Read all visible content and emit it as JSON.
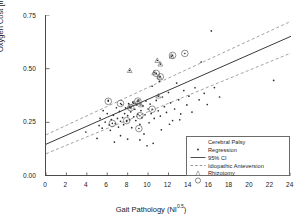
{
  "chart_data": {
    "type": "scatter",
    "title": "",
    "xlabel": "Gait Pathology (NI0.5)",
    "xlabel_base": "Gait Pathology (NI",
    "xlabel_sup": "0.5",
    "xlabel_tail": ")",
    "ylabel": "Oxygen Cost  [ml / m * kg]",
    "xlim": [
      0,
      24
    ],
    "ylim": [
      0.0,
      0.75
    ],
    "xticks": [
      0,
      2,
      4,
      6,
      8,
      10,
      12,
      14,
      16,
      18,
      20,
      22,
      24
    ],
    "yticks": [
      0.0,
      0.25,
      0.5,
      0.75
    ],
    "ytick_labels": [
      "0.00",
      "0.25",
      "0.50",
      "0.75"
    ],
    "xtick_labels": [
      "0",
      "2",
      "4",
      "6",
      "8",
      "10",
      "12",
      "14",
      "16",
      "18",
      "20",
      "22",
      "24"
    ],
    "grid": false,
    "legend_position": "lower-right",
    "colors": {
      "axis": "#4a4a4a",
      "point": "#2b2b2b",
      "regression": "#3a3a3a",
      "ci": "#8a8a8a",
      "anteversion": "#555555",
      "rhizotomy": "#555555",
      "legend_border": "#6b6b6b"
    },
    "legend": [
      {
        "label": "Cerebral Palsy",
        "key": "dot-marker"
      },
      {
        "label": "Regression",
        "key": "solid-line"
      },
      {
        "label": "95% CI",
        "key": "dashed-line"
      },
      {
        "label": "Idiopathic Anteversion",
        "key": "triangle-marker"
      },
      {
        "label": "Rhizotomy",
        "key": "circle-marker"
      }
    ],
    "regression": {
      "x": [
        0,
        24
      ],
      "y": [
        0.148,
        0.651
      ]
    },
    "ci_upper": {
      "x": [
        0,
        24
      ],
      "y": [
        0.192,
        0.721
      ]
    },
    "ci_lower": {
      "x": [
        0,
        24
      ],
      "y": [
        0.104,
        0.573
      ]
    },
    "series": [
      {
        "name": "Cerebral Palsy",
        "marker": "dot",
        "points": [
          [
            3.9,
            0.205
          ],
          [
            5.0,
            0.175
          ],
          [
            5.2,
            0.235
          ],
          [
            5.3,
            0.268
          ],
          [
            5.5,
            0.223
          ],
          [
            5.6,
            0.305
          ],
          [
            5.8,
            0.251
          ],
          [
            6.0,
            0.291
          ],
          [
            6.1,
            0.352
          ],
          [
            6.2,
            0.238
          ],
          [
            6.3,
            0.213
          ],
          [
            6.4,
            0.263
          ],
          [
            6.6,
            0.283
          ],
          [
            6.8,
            0.244
          ],
          [
            6.9,
            0.318
          ],
          [
            7.0,
            0.268
          ],
          [
            7.1,
            0.228
          ],
          [
            7.2,
            0.301
          ],
          [
            7.3,
            0.255
          ],
          [
            7.4,
            0.333
          ],
          [
            7.5,
            0.272
          ],
          [
            7.6,
            0.239
          ],
          [
            7.7,
            0.291
          ],
          [
            7.8,
            0.317
          ],
          [
            7.9,
            0.254
          ],
          [
            8.0,
            0.281
          ],
          [
            8.1,
            0.337
          ],
          [
            8.2,
            0.262
          ],
          [
            8.3,
            0.299
          ],
          [
            8.4,
            0.225
          ],
          [
            8.5,
            0.344
          ],
          [
            8.6,
            0.276
          ],
          [
            8.7,
            0.311
          ],
          [
            8.8,
            0.258
          ],
          [
            8.9,
            0.331
          ],
          [
            9.0,
            0.288
          ],
          [
            9.1,
            0.354
          ],
          [
            9.2,
            0.241
          ],
          [
            9.3,
            0.305
          ],
          [
            9.4,
            0.272
          ],
          [
            9.5,
            0.327
          ],
          [
            9.6,
            0.196
          ],
          [
            9.7,
            0.285
          ],
          [
            9.8,
            0.349
          ],
          [
            10.0,
            0.312
          ],
          [
            10.1,
            0.248
          ],
          [
            10.2,
            0.335
          ],
          [
            10.3,
            0.291
          ],
          [
            10.4,
            0.418
          ],
          [
            10.6,
            0.268
          ],
          [
            10.8,
            0.352
          ],
          [
            11.0,
            0.304
          ],
          [
            11.1,
            0.441
          ],
          [
            11.2,
            0.279
          ],
          [
            11.4,
            0.368
          ],
          [
            11.6,
            0.323
          ],
          [
            11.8,
            0.296
          ],
          [
            12.0,
            0.389
          ],
          [
            12.2,
            0.341
          ],
          [
            12.4,
            0.258
          ],
          [
            12.6,
            0.312
          ],
          [
            12.8,
            0.433
          ],
          [
            13.0,
            0.355
          ],
          [
            13.2,
            0.289
          ],
          [
            13.5,
            0.398
          ],
          [
            13.8,
            0.331
          ],
          [
            14.0,
            0.372
          ],
          [
            14.3,
            0.298
          ],
          [
            14.6,
            0.411
          ],
          [
            15.0,
            0.355
          ],
          [
            15.2,
            0.531
          ],
          [
            15.5,
            0.385
          ],
          [
            15.8,
            0.333
          ],
          [
            16.2,
            0.676
          ],
          [
            16.5,
            0.412
          ],
          [
            17.0,
            0.368
          ],
          [
            22.3,
            0.445
          ],
          [
            9.9,
            0.141
          ],
          [
            10.5,
            0.152
          ],
          [
            6.7,
            0.158
          ],
          [
            8.0,
            0.172
          ],
          [
            12.1,
            0.241
          ],
          [
            13.1,
            0.262
          ],
          [
            11.3,
            0.215
          ],
          [
            7.3,
            0.188
          ],
          [
            9.2,
            0.168
          ]
        ]
      },
      {
        "name": "Idiopathic Anteversion",
        "marker": "triangle",
        "points": [
          [
            8.2,
            0.491
          ],
          [
            10.9,
            0.538
          ],
          [
            11.2,
            0.521
          ],
          [
            11.1,
            0.461
          ],
          [
            10.6,
            0.481
          ],
          [
            12.3,
            0.558
          ],
          [
            9.0,
            0.346
          ],
          [
            8.6,
            0.338
          ],
          [
            9.3,
            0.331
          ],
          [
            8.2,
            0.322
          ],
          [
            11.0,
            0.372
          ]
        ]
      },
      {
        "name": "Rhizotomy",
        "marker": "circle",
        "points": [
          [
            12.4,
            0.562
          ],
          [
            13.6,
            0.571
          ],
          [
            11.2,
            0.462
          ],
          [
            10.8,
            0.478
          ],
          [
            6.1,
            0.348
          ],
          [
            7.3,
            0.338
          ],
          [
            8.3,
            0.318
          ],
          [
            9.0,
            0.349
          ],
          [
            9.2,
            0.281
          ],
          [
            9.1,
            0.221
          ],
          [
            10.4,
            0.311
          ],
          [
            6.5,
            0.245
          ],
          [
            7.9,
            0.258
          ]
        ]
      }
    ]
  }
}
